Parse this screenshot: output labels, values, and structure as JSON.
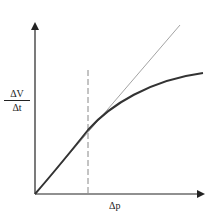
{
  "diagram": {
    "y_axis_label": {
      "numerator": "ΔV",
      "denominator": "Δt"
    },
    "x_axis_label": "Δp",
    "elements": {
      "curve": "concave-down saturating curve from origin",
      "tangent_line": "straight line tangent to curve at origin (thin, grey)",
      "dashed_marker": "vertical dashed line where curve departs from tangent"
    },
    "colors": {
      "axes": "#222222",
      "curve": "#333333",
      "tangent": "#999999",
      "dashed": "#888888"
    }
  }
}
